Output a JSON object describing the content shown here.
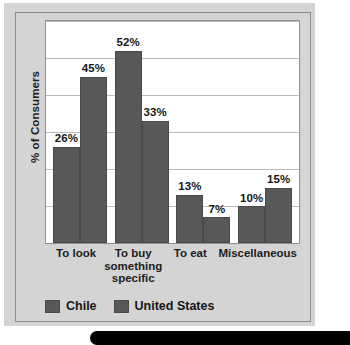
{
  "chart_data": {
    "type": "bar",
    "title": "",
    "xlabel": "",
    "ylabel": "% of Consumers",
    "ylim": [
      0,
      60
    ],
    "grid": true,
    "gridline_count": 6,
    "legend_position": "bottom-left",
    "categories": [
      "To look",
      "To buy something specific",
      "To eat",
      "Miscellaneous"
    ],
    "series": [
      {
        "name": "Chile",
        "color": "#585858",
        "values": [
          26,
          45,
          13,
          10
        ],
        "labels": [
          "26%",
          "45%",
          "13%",
          "10%"
        ]
      },
      {
        "name": "United States",
        "color": "#585858",
        "values": [
          45,
          33,
          7,
          15
        ],
        "labels": [
          "45%",
          "33%",
          "7%",
          "15%"
        ]
      }
    ],
    "groups": [
      {
        "category": "To look",
        "category_lines": [
          "To look"
        ],
        "bars": [
          {
            "series": "Chile",
            "value": 26,
            "label": "26%"
          },
          {
            "series": "United States",
            "value": 45,
            "label": "45%"
          }
        ]
      },
      {
        "category": "To buy something specific",
        "category_lines": [
          "To buy",
          "something",
          "specific"
        ],
        "bars": [
          {
            "series": "Chile",
            "value": 52,
            "label": "52%"
          },
          {
            "series": "United States",
            "value": 33,
            "label": "33%"
          }
        ]
      },
      {
        "category": "To eat",
        "category_lines": [
          "To eat"
        ],
        "bars": [
          {
            "series": "Chile",
            "value": 13,
            "label": "13%"
          },
          {
            "series": "United States",
            "value": 7,
            "label": "7%"
          }
        ]
      },
      {
        "category": "Miscellaneous",
        "category_lines": [
          "Miscellaneous"
        ],
        "bars": [
          {
            "series": "Chile",
            "value": 10,
            "label": "10%"
          },
          {
            "series": "United States",
            "value": 15,
            "label": "15%"
          }
        ]
      }
    ]
  },
  "axis": {
    "y_title": "% of Consumers"
  },
  "legend": {
    "items": [
      {
        "label": "Chile",
        "color": "#585858"
      },
      {
        "label": "United States",
        "color": "#585858"
      }
    ]
  },
  "category_labels": [
    {
      "lines": [
        "To look"
      ]
    },
    {
      "lines": [
        "To buy",
        "something",
        "specific"
      ]
    },
    {
      "lines": [
        "To eat"
      ]
    },
    {
      "lines": [
        "Miscellaneous"
      ]
    }
  ],
  "colors": {
    "bar_fill": "#585858",
    "bar_stroke": "#4a4a4a",
    "plate_background": "#d4d4d4",
    "plot_background": "#ffffff",
    "gridline": "#b9b9b9",
    "frame_border": "#8c8c8c",
    "text": "#161616",
    "accent_bar": "#000000"
  }
}
